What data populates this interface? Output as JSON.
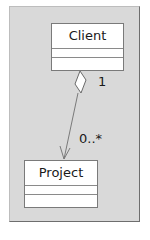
{
  "diagram": {
    "type": "uml-class-diagram",
    "background": "#d9d9d9",
    "classes": [
      {
        "name": "Client",
        "attributes": [],
        "operations": []
      },
      {
        "name": "Project",
        "attributes": [],
        "operations": []
      }
    ],
    "association": {
      "kind": "aggregation",
      "from": "Client",
      "to": "Project",
      "navigable_to": "Project",
      "source_multiplicity": "1",
      "target_multiplicity": "0..*"
    }
  }
}
